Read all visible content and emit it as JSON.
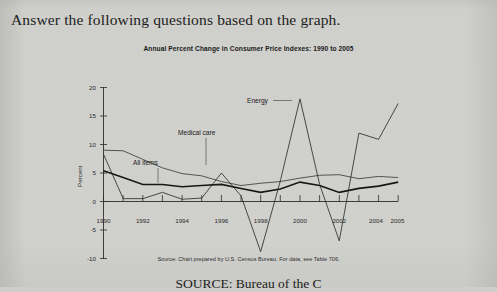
{
  "page": {
    "prompt": "Answer the following questions based on the graph.",
    "bottom_caption": "SOURCE: Bureau of the C",
    "background_color": "#cdcdc9",
    "text_color": "#1d1d1d"
  },
  "figure": {
    "title": "Annual Percent Change in Consumer Price Indexes: 1990 to 2005",
    "source_note": "Source: Chart prepared by U.S. Census Bureau. For data, see Table 706.",
    "series_labels": {
      "energy": "Energy",
      "medical_care": "Medical care",
      "all_items": "All items"
    }
  },
  "chart_data": {
    "type": "line",
    "title": "Annual Percent Change in Consumer Price Indexes: 1990 to 2005",
    "xlabel": "",
    "ylabel": "Percent",
    "x": [
      1990,
      1991,
      1992,
      1993,
      1994,
      1995,
      1996,
      1997,
      1998,
      1999,
      2000,
      2001,
      2002,
      2003,
      2004,
      2005
    ],
    "xtick_labels": [
      "1990",
      "1992",
      "1994",
      "1996",
      "1998",
      "2000",
      "2002",
      "2004",
      "2005"
    ],
    "xtick_values": [
      1990,
      1992,
      1994,
      1996,
      1998,
      2000,
      2002,
      2004,
      2005
    ],
    "ytick_labels": [
      "20",
      "15",
      "10",
      "5",
      "0",
      "-5",
      "-10"
    ],
    "ytick_values": [
      20,
      15,
      10,
      5,
      0,
      -5,
      -10
    ],
    "xlim": [
      1990,
      2005
    ],
    "ylim": [
      -10,
      20
    ],
    "grid": false,
    "legend": "inline-labels",
    "series": [
      {
        "name": "Medical care",
        "color": "#3c3c3c",
        "values": [
          9.0,
          8.9,
          7.4,
          5.9,
          4.9,
          4.5,
          3.5,
          2.8,
          3.2,
          3.5,
          4.1,
          4.6,
          4.7,
          4.0,
          4.4,
          4.2
        ]
      },
      {
        "name": "All items",
        "color": "#171717",
        "values": [
          5.4,
          4.2,
          3.0,
          3.0,
          2.6,
          2.8,
          3.0,
          2.3,
          1.6,
          2.2,
          3.4,
          2.8,
          1.6,
          2.3,
          2.7,
          3.4
        ]
      },
      {
        "name": "Energy",
        "color": "#2e2e2e",
        "values": [
          8.3,
          0.5,
          0.5,
          1.6,
          0.4,
          0.6,
          5.0,
          1.0,
          -8.8,
          3.6,
          18.0,
          3.0,
          -6.9,
          12.0,
          10.9,
          17.2
        ]
      }
    ]
  }
}
